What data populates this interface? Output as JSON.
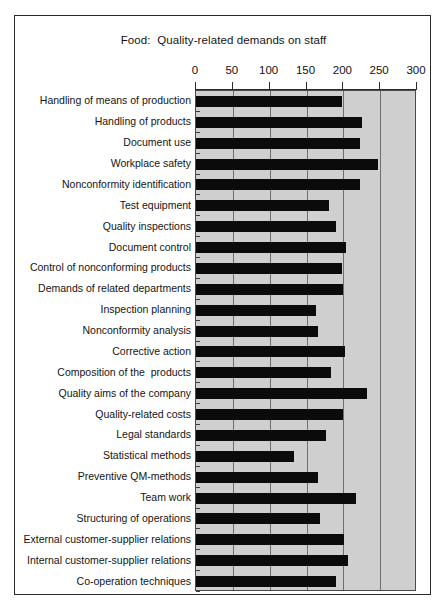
{
  "figure": {
    "title": "Food:  Quality-related demands on staff",
    "background_color": "#ffffff",
    "frame_color": "#2b2b2b",
    "plot_background_color": "#cfcfcf",
    "bar_color": "#0b0b0b",
    "gridline_color": "#6e6e6e"
  },
  "chart_data": {
    "type": "bar",
    "orientation": "horizontal",
    "title": "Food:  Quality-related demands on staff",
    "xlabel": "",
    "ylabel": "",
    "xlim": [
      0,
      300
    ],
    "xticks": [
      0,
      50,
      100,
      150,
      200,
      250,
      300
    ],
    "xtick_labels": [
      "0",
      "50",
      "100",
      "150",
      "200",
      "250",
      "300"
    ],
    "grid": true,
    "grid_axis": "x",
    "legend": false,
    "categories": [
      "Handling of means of production",
      "Handling of products",
      "Document use",
      "Workplace safety",
      "Nonconformity identification",
      "Test equipment",
      "Quality inspections",
      "Document control",
      "Control of nonconforming products",
      "Demands of related departments",
      "Inspection planning",
      "Nonconformity analysis",
      "Corrective action",
      "Composition of the  products",
      "Quality aims of the company",
      "Quality-related costs",
      "Legal standards",
      "Statistical methods",
      "Preventive QM-methods",
      "Team work",
      "Structuring of operations",
      "External customer-supplier relations",
      "Internal customer-supplier relations",
      "Co-operation techniques"
    ],
    "values": [
      198,
      226,
      223,
      247,
      222,
      180,
      190,
      203,
      198,
      200,
      163,
      166,
      202,
      183,
      232,
      200,
      176,
      133,
      165,
      217,
      168,
      201,
      207,
      190
    ]
  }
}
